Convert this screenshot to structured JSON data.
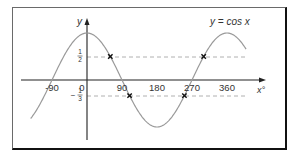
{
  "chart_data": {
    "type": "line",
    "title": "",
    "curve_label": "y = cos x",
    "xlabel": "x°",
    "ylabel": "y",
    "x_ticks": [
      "-90",
      "0",
      "90",
      "180",
      "270",
      "360"
    ],
    "x_tick_values": [
      -90,
      0,
      90,
      180,
      270,
      360
    ],
    "y_ticks": [
      {
        "label_num": "1",
        "label_den": "2",
        "value": 0.5,
        "sign": ""
      },
      {
        "label_num": "1",
        "label_den": "3",
        "value": -0.3333,
        "sign": "−"
      }
    ],
    "xlim": [
      -145,
      410
    ],
    "ylim": [
      -1,
      1
    ],
    "grid": false,
    "series": [
      {
        "name": "y = cos x",
        "function": "cos(x°)",
        "x_range": [
          -145,
          410
        ]
      }
    ],
    "reference_lines": [
      {
        "type": "horizontal",
        "y": 0.5,
        "style": "dashed",
        "x_from": 0,
        "x_to": 410
      },
      {
        "type": "horizontal",
        "y": -0.3333,
        "style": "dashed",
        "x_from": 0,
        "x_to": 410
      }
    ],
    "marked_points": [
      {
        "x": 60,
        "y": 0.5,
        "marker": "x"
      },
      {
        "x": 109.5,
        "y": -0.3333,
        "marker": "x"
      },
      {
        "x": 250.5,
        "y": -0.3333,
        "marker": "x"
      },
      {
        "x": 300,
        "y": 0.5,
        "marker": "x"
      }
    ],
    "colors": {
      "curve": "#9a9a9a",
      "axes": "#222222",
      "dashed": "#b0b0b0",
      "marker": "#111111"
    }
  }
}
